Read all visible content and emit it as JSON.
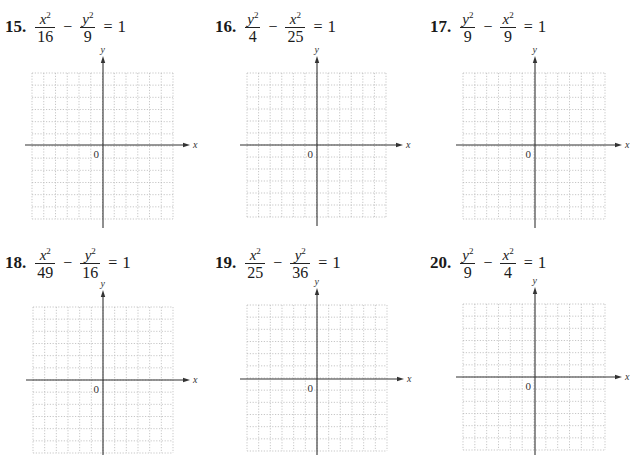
{
  "problems": [
    {
      "number": "15.",
      "term1": {
        "var": "x",
        "exp": "2",
        "den": "16"
      },
      "op": "−",
      "term2": {
        "var": "y",
        "exp": "2",
        "den": "9"
      },
      "eq": "=",
      "rhs": "1",
      "graph": {
        "x_label": "x",
        "y_label": "y",
        "origin_label": "0",
        "grid_cols": 12,
        "grid_rows": 12
      }
    },
    {
      "number": "16.",
      "term1": {
        "var": "y",
        "exp": "2",
        "den": "4"
      },
      "op": "−",
      "term2": {
        "var": "x",
        "exp": "2",
        "den": "25"
      },
      "eq": "=",
      "rhs": "1",
      "graph": {
        "x_label": "x",
        "y_label": "y",
        "origin_label": "0",
        "grid_cols": 12,
        "grid_rows": 12
      }
    },
    {
      "number": "17.",
      "term1": {
        "var": "y",
        "exp": "2",
        "den": "9"
      },
      "op": "−",
      "term2": {
        "var": "x",
        "exp": "2",
        "den": "9"
      },
      "eq": "=",
      "rhs": "1",
      "graph": {
        "x_label": "x",
        "y_label": "y",
        "origin_label": "0",
        "grid_cols": 12,
        "grid_rows": 12
      }
    },
    {
      "number": "18.",
      "term1": {
        "var": "x",
        "exp": "2",
        "den": "49"
      },
      "op": "−",
      "term2": {
        "var": "y",
        "exp": "2",
        "den": "16"
      },
      "eq": "=",
      "rhs": "1",
      "graph": {
        "x_label": "x",
        "y_label": "y",
        "origin_label": "0",
        "grid_cols": 12,
        "grid_rows": 12
      }
    },
    {
      "number": "19.",
      "term1": {
        "var": "x",
        "exp": "2",
        "den": "25"
      },
      "op": "−",
      "term2": {
        "var": "y",
        "exp": "2",
        "den": "36"
      },
      "eq": "=",
      "rhs": "1",
      "graph": {
        "x_label": "x",
        "y_label": "y",
        "origin_label": "0",
        "grid_cols": 12,
        "grid_rows": 12
      }
    },
    {
      "number": "20.",
      "term1": {
        "var": "y",
        "exp": "2",
        "den": "9"
      },
      "op": "−",
      "term2": {
        "var": "x",
        "exp": "2",
        "den": "4"
      },
      "eq": "=",
      "rhs": "1",
      "graph": {
        "x_label": "x",
        "y_label": "y",
        "origin_label": "0",
        "grid_cols": 12,
        "grid_rows": 12
      }
    }
  ]
}
